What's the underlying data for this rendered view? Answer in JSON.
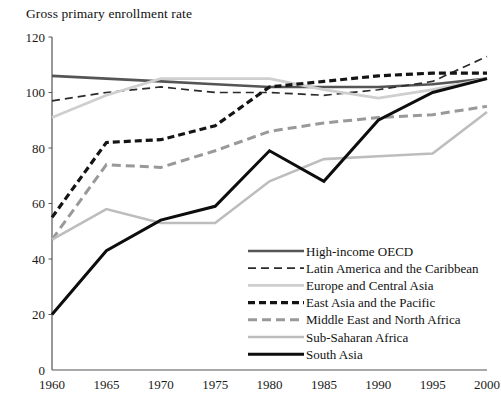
{
  "chart_data": {
    "type": "line",
    "title": "Gross primary enrollment rate",
    "xlabel": "",
    "ylabel": "",
    "x": [
      1960,
      1965,
      1970,
      1975,
      1980,
      1985,
      1990,
      1995,
      2000
    ],
    "xticklabels": [
      "1960",
      "1965",
      "1970",
      "1975",
      "1980",
      "1985",
      "1990",
      "1995",
      "2000"
    ],
    "yticklabels": [
      "0",
      "20",
      "40",
      "60",
      "80",
      "100",
      "120"
    ],
    "yticks": [
      0,
      20,
      40,
      60,
      80,
      100,
      120
    ],
    "ylim": [
      0,
      120
    ],
    "xlim": [
      1960,
      2000
    ],
    "grid": false,
    "legend_position": "lower-right-inside",
    "series": [
      {
        "name": "High-income OECD",
        "values": [
          106,
          105,
          104,
          103,
          102,
          102,
          102,
          103,
          105
        ],
        "color": "#555555",
        "style": "solid",
        "width": 2.6
      },
      {
        "name": "Latin America and the Caribbean",
        "values": [
          97,
          100,
          102,
          100,
          100,
          99,
          101,
          104,
          113
        ],
        "color": "#2b2b2b",
        "style": "dashed",
        "width": 1.7
      },
      {
        "name": "Europe and Central Asia",
        "values": [
          91,
          99,
          105,
          105,
          105,
          101,
          98,
          101,
          105
        ],
        "color": "#cfcfcf",
        "style": "solid",
        "width": 2.8
      },
      {
        "name": "East Asia and the Pacific",
        "values": [
          55,
          82,
          83,
          88,
          102,
          104,
          106,
          107,
          107
        ],
        "color": "#141414",
        "style": "thick-dashed",
        "width": 3.2
      },
      {
        "name": "Middle East and North Africa",
        "values": [
          47,
          74,
          73,
          79,
          86,
          89,
          91,
          92,
          95
        ],
        "color": "#999999",
        "style": "dashed",
        "width": 3.0
      },
      {
        "name": "Sub-Saharan Africa",
        "values": [
          47,
          58,
          53,
          53,
          68,
          76,
          77,
          78,
          93
        ],
        "color": "#bdbdbd",
        "style": "solid",
        "width": 2.6
      },
      {
        "name": "South Asia",
        "values": [
          20,
          43,
          54,
          59,
          79,
          68,
          90,
          100,
          105
        ],
        "color": "#0d0d0d",
        "style": "solid",
        "width": 3.0
      }
    ]
  },
  "legend": {
    "items": [
      {
        "label": "High-income OECD"
      },
      {
        "label": "Latin America and the Caribbean"
      },
      {
        "label": "Europe and Central Asia"
      },
      {
        "label": "East Asia and the Pacific"
      },
      {
        "label": "Middle East and North Africa"
      },
      {
        "label": "Sub-Saharan Africa"
      },
      {
        "label": "South Asia"
      }
    ]
  }
}
